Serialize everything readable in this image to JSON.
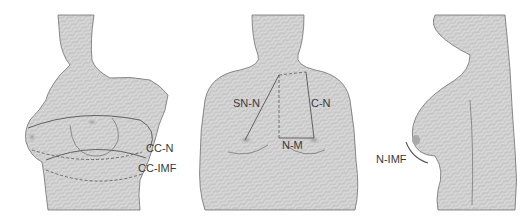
{
  "figure": {
    "panels": [
      {
        "name": "oblique-view",
        "labels": [
          "CC-N",
          "CC-IMF"
        ]
      },
      {
        "name": "frontal-view",
        "labels": [
          "SN-N",
          "C-N",
          "N-M"
        ]
      },
      {
        "name": "lateral-view",
        "labels": [
          "N-IMF"
        ]
      }
    ]
  },
  "labels": {
    "cc_n": "CC-N",
    "cc_imf": "CC-IMF",
    "sn_n": "SN-N",
    "c_n": "C-N",
    "n_m": "N-M",
    "n_imf": "N-IMF"
  },
  "colors": {
    "skin_fill": "#d6d6d6",
    "stripe": "#c4c4c4",
    "outline": "#6e6e6e",
    "measure_line": "#555555",
    "nipple": "#a9a9a9",
    "text": "#3a3a3a",
    "background": "#ffffff"
  }
}
